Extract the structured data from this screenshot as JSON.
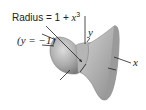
{
  "figure": {
    "radius_label": "Radius = 1 + x",
    "radius_label_prefix": "Radius",
    "radius_label_eq": "= 1 + ",
    "radius_label_var": "x",
    "radius_label_exp": "3",
    "axis_line_label": "(y = −1)",
    "y_axis_label": "y",
    "x_axis_label": "x",
    "colors": {
      "surface_light": "#c8c8c8",
      "surface_mid": "#a9a9a9",
      "surface_dark": "#7a7a7a",
      "line": "#222222"
    }
  }
}
